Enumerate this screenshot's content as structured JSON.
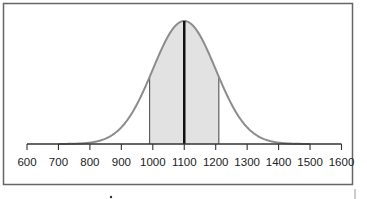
{
  "chart_data": {
    "type": "area",
    "subtype": "normal-distribution",
    "title": "",
    "xlabel": "",
    "ylabel": "",
    "xlim": [
      600,
      1600
    ],
    "x_ticks": [
      600,
      700,
      800,
      900,
      1000,
      1100,
      1200,
      1300,
      1400,
      1500,
      1600
    ],
    "x_tick_labels": [
      "600",
      "700",
      "800",
      "900",
      "1000",
      "1100",
      "1200",
      "1300",
      "1400",
      "1500",
      "1600"
    ],
    "mean": 1100,
    "std_dev": 100,
    "shaded_region": [
      990,
      1210
    ],
    "mean_line": 1100,
    "grid": false,
    "legend": null
  },
  "colors": {
    "curve": "#8c8c8c",
    "shading": "#e2e2e2",
    "mean_line": "#111111",
    "axis": "#333333",
    "frame": "#666666"
  }
}
